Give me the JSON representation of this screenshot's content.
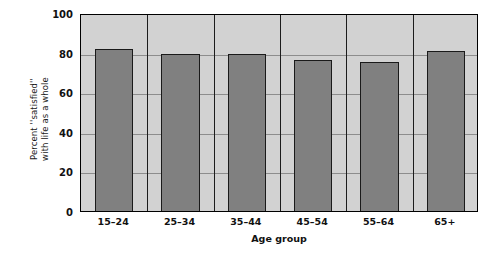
{
  "chart_data": {
    "type": "bar",
    "title": "",
    "subtitle": "",
    "categories": [
      "15–24",
      "25–34",
      "35–44",
      "45–54",
      "55–64",
      "65+"
    ],
    "values": [
      82,
      79.5,
      79.5,
      76.5,
      75.5,
      81
    ],
    "xlabel": "Age group",
    "ylabel_line1": "Percent ''satisfied''",
    "ylabel_line2": "with life as a whole",
    "ylabel": "Percent ''satisfied'' with life as a whole",
    "ylim": [
      0,
      100
    ],
    "yticks": [
      0,
      20,
      40,
      60,
      80,
      100
    ],
    "ytick_labels": [
      "0",
      "20",
      "40",
      "60",
      "80",
      "100"
    ],
    "grid": true,
    "grid_axis": "y",
    "legend": false,
    "legend_position": "none",
    "colors": {
      "bar_fill": "#808080",
      "bar_edge": "#1a1a1a",
      "plot_background": "#d2d2d2",
      "page_background": "#ffffff",
      "gridline": "#8d8d8d",
      "axis": "#000000",
      "text": "#111111"
    }
  }
}
